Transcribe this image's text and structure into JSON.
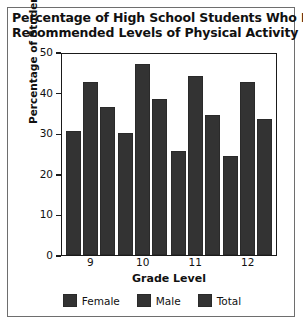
{
  "chart_data": {
    "type": "bar",
    "title": "Percentage of High School Students Who Met Recommended Levels of Physical Activity",
    "title_lines": [
      "Percentage of High School Students Who Met",
      "Recommended Levels of Physical Activity"
    ],
    "xlabel": "Grade Level",
    "ylabel": "Percentage of Students",
    "categories": [
      "9",
      "10",
      "11",
      "12"
    ],
    "series": [
      {
        "name": "Female",
        "values": [
          30.5,
          30.0,
          25.5,
          24.5
        ],
        "color": "#333333"
      },
      {
        "name": "Male",
        "values": [
          42.5,
          47.0,
          44.0,
          42.5
        ],
        "color": "#333333"
      },
      {
        "name": "Total",
        "values": [
          36.5,
          38.5,
          34.5,
          33.5
        ],
        "color": "#333333"
      }
    ],
    "ylim": [
      0,
      50
    ],
    "yticks": [
      0,
      10,
      20,
      30,
      40,
      50
    ],
    "ytick_labels": [
      "0",
      "10",
      "20",
      "30",
      "40",
      "50"
    ],
    "grid": false,
    "legend_position": "bottom",
    "bar_color": "#333333",
    "plot_border_color": "#1a1a1a",
    "background": "#ffffff"
  },
  "legend": {
    "items": [
      {
        "label": "Female"
      },
      {
        "label": "Male"
      },
      {
        "label": "Total"
      }
    ]
  }
}
